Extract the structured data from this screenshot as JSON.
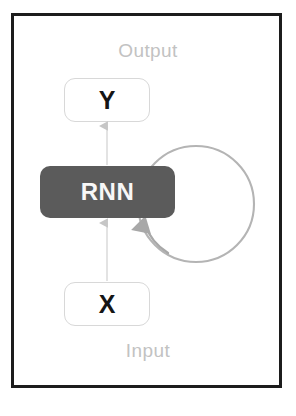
{
  "diagram": {
    "title_present": false,
    "frame": {
      "border_color": "#1c1c1c"
    },
    "labels": {
      "output": "Output",
      "input": "Input",
      "label_color": "#c2c2c2"
    },
    "nodes": [
      {
        "id": "y",
        "label": "Y",
        "role": "output-node",
        "fill": "#ffffff",
        "border_color": "#d8d8d8",
        "text_color": "#151515"
      },
      {
        "id": "rnn",
        "label": "RNN",
        "role": "recurrent-cell",
        "fill": "#5b5b5b",
        "border_color": "#5b5b5b",
        "text_color": "#f7f7f7"
      },
      {
        "id": "x",
        "label": "X",
        "role": "input-node",
        "fill": "#ffffff",
        "border_color": "#d8d8d8",
        "text_color": "#151515"
      }
    ],
    "edges": [
      {
        "id": "x-to-rnn",
        "from": "x",
        "to": "rnn",
        "direction": "up",
        "color": "#dcdcdc"
      },
      {
        "id": "rnn-to-y",
        "from": "rnn",
        "to": "y",
        "direction": "up",
        "color": "#dcdcdc"
      },
      {
        "id": "rnn-self-loop",
        "from": "rnn",
        "to": "rnn",
        "direction": "loop",
        "color": "#b4b4b4"
      }
    ]
  }
}
